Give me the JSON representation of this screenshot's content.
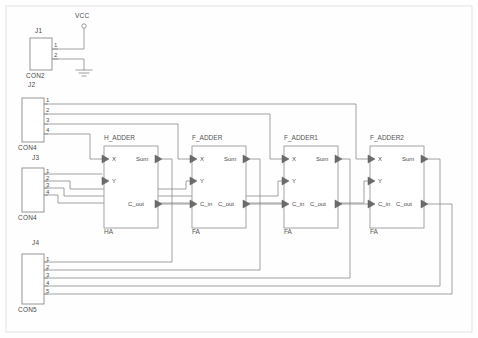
{
  "sheet": {
    "title": "4-bit Ripple Carry Adder Schematic",
    "background": "#fefefe",
    "wire_color": "#8c8c8c",
    "outline_color": "#9a9a9a",
    "text_color": "#4a4a4a",
    "border_color": "#d8d8d8"
  },
  "power": {
    "vcc_label": "VCC",
    "gnd_symbol": "ground"
  },
  "connectors": [
    {
      "ref": "J1",
      "type": "CON2",
      "x": 30,
      "y": 38,
      "w": 22,
      "h": 32,
      "pins": [
        "1",
        "2"
      ]
    },
    {
      "ref": "J2",
      "type": "CON4",
      "x": 22,
      "y": 98,
      "w": 22,
      "h": 44,
      "pins": [
        "1",
        "2",
        "3",
        "4"
      ]
    },
    {
      "ref": "J3",
      "type": "CON4",
      "x": 22,
      "y": 168,
      "w": 22,
      "h": 44,
      "pins": [
        "1",
        "2",
        "3",
        "4"
      ]
    },
    {
      "ref": "J4",
      "type": "CON5",
      "x": 22,
      "y": 254,
      "w": 22,
      "h": 50,
      "pins": [
        "1",
        "2",
        "3",
        "4",
        "5"
      ]
    }
  ],
  "blocks": [
    {
      "ref": "H_ADDER",
      "sublabel": "HA",
      "x": 104,
      "y": 146,
      "w": 54,
      "h": 82,
      "inputs": [
        "X",
        "Y"
      ],
      "outputs": [
        "Sum",
        "C_out"
      ],
      "has_cin": false
    },
    {
      "ref": "F_ADDER",
      "sublabel": "FA",
      "x": 192,
      "y": 146,
      "w": 54,
      "h": 82,
      "inputs": [
        "X",
        "Y",
        "C_in"
      ],
      "outputs": [
        "Sum",
        "C_out"
      ],
      "has_cin": true
    },
    {
      "ref": "F_ADDER1",
      "sublabel": "FA",
      "x": 284,
      "y": 146,
      "w": 54,
      "h": 82,
      "inputs": [
        "X",
        "Y",
        "C_in"
      ],
      "outputs": [
        "Sum",
        "C_out"
      ],
      "has_cin": true
    },
    {
      "ref": "F_ADDER2",
      "sublabel": "FA",
      "x": 370,
      "y": 146,
      "w": 54,
      "h": 82,
      "inputs": [
        "X",
        "Y",
        "C_in"
      ],
      "outputs": [
        "Sum",
        "C_out"
      ],
      "has_cin": true
    }
  ],
  "port_labels": {
    "x": "X",
    "y": "Y",
    "sum": "Sum",
    "cin": "C_in",
    "cout": "C_out"
  }
}
